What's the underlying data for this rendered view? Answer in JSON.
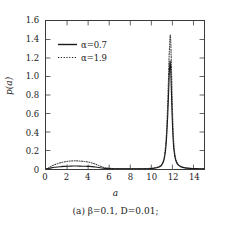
{
  "figure": {
    "caption": "(a) β=0.1, D=0.01;",
    "background_color": "#ffffff",
    "line_color": "#1a1a1a",
    "frame_color": "#3a3a3a"
  },
  "chart_data": {
    "type": "line",
    "title": "",
    "xlabel": "a",
    "ylabel": "p(a)",
    "xlim": [
      0,
      15
    ],
    "ylim": [
      0,
      1.6
    ],
    "xticks": [
      0,
      2,
      4,
      6,
      8,
      10,
      12,
      14
    ],
    "xtick_labels": [
      "0",
      "2",
      "4",
      "6",
      "8",
      "10",
      "12",
      "14"
    ],
    "yticks": [
      0,
      0.2,
      0.4,
      0.6,
      0.8,
      1.0,
      1.2,
      1.4,
      1.6
    ],
    "ytick_labels": [
      "0",
      "0.2",
      "0.4",
      "0.6",
      "0.8",
      "1.0",
      "1.2",
      "1.4",
      "1.6"
    ],
    "grid": false,
    "legend_position": "upper-left",
    "tick_direction": "in",
    "series": [
      {
        "name": "α=0.7",
        "linestyle": "solid",
        "color": "#1a1a1a",
        "peak_x": 11.78,
        "peak_y": 1.17,
        "bump_peak_x": 3.0,
        "bump_peak_y": 0.032,
        "x": [
          0.0,
          0.25,
          0.5,
          0.8,
          1.1,
          1.4,
          1.7,
          2.0,
          2.3,
          2.6,
          2.9,
          3.2,
          3.5,
          3.8,
          4.1,
          4.4,
          4.7,
          5.0,
          5.3,
          5.6,
          6.0,
          6.5,
          7.0,
          7.5,
          8.0,
          8.5,
          9.0,
          9.5,
          10.0,
          10.4,
          10.8,
          11.0,
          11.2,
          11.35,
          11.45,
          11.55,
          11.62,
          11.68,
          11.72,
          11.76,
          11.78,
          11.81,
          11.85,
          11.9,
          11.96,
          12.05,
          12.15,
          12.3,
          12.5,
          12.8,
          13.2,
          13.6,
          14.0,
          14.5,
          15.0
        ],
        "y": [
          0.0,
          0.006,
          0.012,
          0.018,
          0.022,
          0.025,
          0.028,
          0.03,
          0.031,
          0.032,
          0.032,
          0.031,
          0.03,
          0.029,
          0.028,
          0.026,
          0.022,
          0.017,
          0.011,
          0.007,
          0.004,
          0.003,
          0.002,
          0.002,
          0.002,
          0.002,
          0.002,
          0.003,
          0.005,
          0.01,
          0.025,
          0.045,
          0.095,
          0.2,
          0.34,
          0.56,
          0.76,
          0.96,
          1.06,
          1.14,
          1.17,
          1.14,
          1.04,
          0.86,
          0.62,
          0.36,
          0.2,
          0.1,
          0.05,
          0.025,
          0.012,
          0.007,
          0.005,
          0.003,
          0.002
        ]
      },
      {
        "name": "α=1.9",
        "linestyle": "dotted",
        "color": "#1a1a1a",
        "peak_x": 11.8,
        "peak_y": 1.45,
        "bump_peak_x": 2.9,
        "bump_peak_y": 0.088,
        "x": [
          0.0,
          0.25,
          0.5,
          0.8,
          1.1,
          1.4,
          1.7,
          2.0,
          2.3,
          2.6,
          2.9,
          3.2,
          3.5,
          3.8,
          4.1,
          4.4,
          4.7,
          5.0,
          5.3,
          5.6,
          6.0,
          6.5,
          7.0,
          7.5,
          8.0,
          8.5,
          9.0,
          9.5,
          10.0,
          10.4,
          10.8,
          11.0,
          11.2,
          11.35,
          11.45,
          11.55,
          11.62,
          11.68,
          11.74,
          11.78,
          11.8,
          11.83,
          11.87,
          11.92,
          11.98,
          12.06,
          12.16,
          12.3,
          12.5,
          12.8,
          13.2,
          13.6,
          14.0,
          14.5,
          15.0
        ],
        "y": [
          0.0,
          0.014,
          0.03,
          0.046,
          0.058,
          0.068,
          0.076,
          0.082,
          0.086,
          0.088,
          0.088,
          0.086,
          0.083,
          0.079,
          0.073,
          0.064,
          0.052,
          0.038,
          0.024,
          0.014,
          0.008,
          0.005,
          0.004,
          0.003,
          0.003,
          0.003,
          0.004,
          0.005,
          0.008,
          0.014,
          0.032,
          0.055,
          0.115,
          0.25,
          0.42,
          0.7,
          0.95,
          1.19,
          1.35,
          1.43,
          1.45,
          1.41,
          1.28,
          1.05,
          0.76,
          0.44,
          0.24,
          0.12,
          0.06,
          0.028,
          0.014,
          0.008,
          0.005,
          0.003,
          0.002
        ]
      }
    ]
  },
  "legend": {
    "items": [
      {
        "label": "α=0.7",
        "style": "solid"
      },
      {
        "label": "α=1.9",
        "style": "dotted"
      }
    ]
  }
}
